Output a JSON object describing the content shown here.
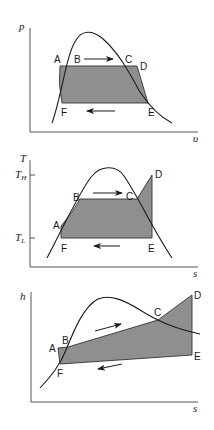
{
  "diagrams": [
    {
      "id": "pv",
      "title": "p-v diagram",
      "ylabel": "p",
      "xlabel": "υ",
      "points": {
        "A": "A",
        "B": "B",
        "C": "C",
        "D": "D",
        "E": "E",
        "F": "F"
      }
    },
    {
      "id": "ts",
      "title": "T-s diagram",
      "ylabel": "T",
      "xlabel": "s",
      "ticks": {
        "high": "T",
        "high_sub": "H",
        "low": "T",
        "low_sub": "L"
      },
      "points": {
        "A": "A",
        "B": "B",
        "C": "C",
        "D": "D",
        "E": "E",
        "F": "F"
      }
    },
    {
      "id": "hs",
      "title": "h-s diagram",
      "ylabel": "h",
      "xlabel": "s",
      "points": {
        "A": "A",
        "B": "B",
        "C": "C",
        "D": "D",
        "E": "E",
        "F": "F"
      }
    }
  ],
  "colors": {
    "shade": "#8f8f8f",
    "line": "#1a1a1a",
    "axis": "#555555"
  }
}
